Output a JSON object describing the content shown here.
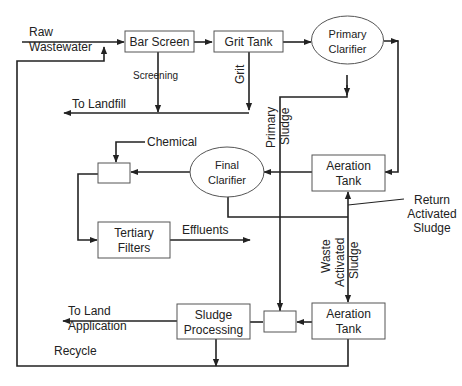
{
  "diagram": {
    "type": "wastewater treatment process flow",
    "nodes": {
      "bar_screen": "Bar Screen",
      "grit_tank": "Grit Tank",
      "primary_clarifier_l1": "Primary",
      "primary_clarifier_l2": "Clarifier",
      "aeration_tank_1_l1": "Aeration",
      "aeration_tank_1_l2": "Tank",
      "final_clarifier_l1": "Final",
      "final_clarifier_l2": "Clarifier",
      "tertiary_filters_l1": "Tertiary",
      "tertiary_filters_l2": "Filters",
      "sludge_processing_l1": "Sludge",
      "sludge_processing_l2": "Processing",
      "aeration_tank_2_l1": "Aeration",
      "aeration_tank_2_l2": "Tank"
    },
    "labels": {
      "raw_l1": "Raw",
      "raw_l2": "Wastewater",
      "screening": "Screening",
      "to_landfill": "To Landfill",
      "grit": "Grit",
      "primary_sludge_l1": "Primary",
      "primary_sludge_l2": "Sludge",
      "chemical": "Chemical",
      "effluents": "Effluents",
      "return_l1": "Return",
      "return_l2": "Activated",
      "return_l3": "Sludge",
      "waste_l1": "Waste",
      "waste_l2": "Activated",
      "waste_l3": "Sludge",
      "to_land_l1": "To Land",
      "to_land_l2": "Application",
      "recycle": "Recycle"
    },
    "edges": [
      {
        "from": "Raw Wastewater",
        "to": "Bar Screen"
      },
      {
        "from": "Bar Screen",
        "to": "Grit Tank"
      },
      {
        "from": "Grit Tank",
        "to": "Primary Clarifier"
      },
      {
        "from": "Bar Screen",
        "to": "To Landfill",
        "label": "Screening"
      },
      {
        "from": "Grit Tank",
        "to": "To Landfill",
        "label": "Grit"
      },
      {
        "from": "Primary Clarifier",
        "to": "Aeration Tank"
      },
      {
        "from": "Primary Clarifier",
        "to": "Mixing Box",
        "label": "Primary Sludge"
      },
      {
        "from": "Aeration Tank",
        "to": "Final Clarifier"
      },
      {
        "from": "Final Clarifier",
        "to": "Chemical Mixing Box"
      },
      {
        "from": "Chemical",
        "to": "Chemical Mixing Box"
      },
      {
        "from": "Chemical Mixing Box",
        "to": "Tertiary Filters"
      },
      {
        "from": "Tertiary Filters",
        "to": "Effluents"
      },
      {
        "from": "Final Clarifier",
        "to": "Aeration Tank",
        "label": "Return Activated Sludge"
      },
      {
        "from": "Final Clarifier",
        "to": "Aeration Tank (lower)",
        "label": "Waste Activated Sludge"
      },
      {
        "from": "Aeration Tank (lower)",
        "to": "Mixing Box"
      },
      {
        "from": "Mixing Box",
        "to": "Sludge Processing"
      },
      {
        "from": "Sludge Processing",
        "to": "To Land Application"
      },
      {
        "from": "Sludge Processing / Aeration Tank (lower)",
        "to": "Raw Wastewater",
        "label": "Recycle"
      }
    ]
  }
}
